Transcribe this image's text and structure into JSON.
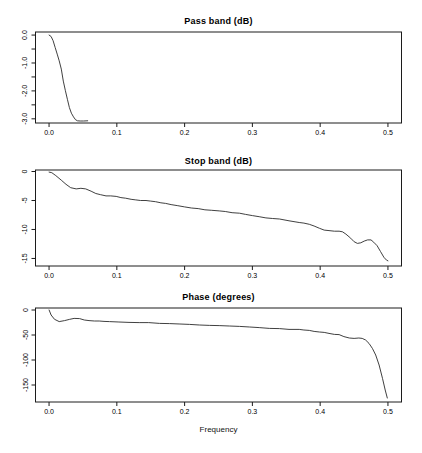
{
  "figure": {
    "width": 422,
    "height": 453,
    "background": "#ffffff",
    "axis_color": "#1c1c1c",
    "curve_color": "#2a2a2a",
    "text_color": "#000000"
  },
  "chart_data": [
    {
      "type": "line",
      "title": "Pass band (dB)",
      "xlabel": "",
      "ylabel": "",
      "xlim": [
        -0.02,
        0.52
      ],
      "ylim": [
        -3.15,
        0.11
      ],
      "xticks": [
        0.0,
        0.1,
        0.2,
        0.3,
        0.4,
        0.5
      ],
      "xtick_labels": [
        "0.0",
        "0.1",
        "0.2",
        "0.3",
        "0.4",
        "0.5"
      ],
      "yticks": [
        0,
        -1,
        -2,
        -3
      ],
      "ytick_labels": [
        "0.0",
        "-1.0",
        "-2.0",
        "-3.0"
      ],
      "yticks_minor": [
        -0.5,
        -1.5,
        -2.5
      ],
      "x": [
        0,
        0.003,
        0.006,
        0.009,
        0.012,
        0.015,
        0.018,
        0.021,
        0.024,
        0.027,
        0.03,
        0.033,
        0.036,
        0.039,
        0.042,
        0.046,
        0.051,
        0.057
      ],
      "y": [
        0,
        -0.05,
        -0.2,
        -0.45,
        -0.68,
        -0.92,
        -1.22,
        -1.65,
        -1.98,
        -2.3,
        -2.6,
        -2.8,
        -2.93,
        -3.03,
        -3.07,
        -3.08,
        -3.08,
        -3.07
      ]
    },
    {
      "type": "line",
      "title": "Stop band (dB)",
      "xlabel": "",
      "ylabel": "",
      "xlim": [
        -0.02,
        0.52
      ],
      "ylim": [
        -16.3,
        0.26
      ],
      "xticks": [
        0.0,
        0.1,
        0.2,
        0.3,
        0.4,
        0.5
      ],
      "xtick_labels": [
        "0.0",
        "0.1",
        "0.2",
        "0.3",
        "0.4",
        "0.5"
      ],
      "yticks": [
        0,
        -5,
        -10,
        -15
      ],
      "ytick_labels": [
        "0",
        "-5",
        "-10",
        "-15"
      ],
      "yticks_minor": [],
      "x": [
        0,
        0.004,
        0.01,
        0.018,
        0.025,
        0.032,
        0.04,
        0.047,
        0.054,
        0.062,
        0.069,
        0.076,
        0.084,
        0.091,
        0.099,
        0.106,
        0.113,
        0.121,
        0.128,
        0.135,
        0.143,
        0.15,
        0.157,
        0.165,
        0.172,
        0.18,
        0.19,
        0.2,
        0.21,
        0.22,
        0.23,
        0.24,
        0.251,
        0.26,
        0.27,
        0.281,
        0.29,
        0.3,
        0.31,
        0.32,
        0.33,
        0.34,
        0.354,
        0.369,
        0.376,
        0.384,
        0.391,
        0.399,
        0.406,
        0.413,
        0.421,
        0.428,
        0.433,
        0.438,
        0.445,
        0.45,
        0.455,
        0.46,
        0.465,
        0.47,
        0.475,
        0.479,
        0.484,
        0.489,
        0.494,
        0.498,
        0.5
      ],
      "y": [
        -0.1,
        -0.2,
        -0.7,
        -1.5,
        -2.2,
        -2.8,
        -3.0,
        -2.9,
        -3.0,
        -3.4,
        -3.8,
        -4.0,
        -4.2,
        -4.2,
        -4.3,
        -4.5,
        -4.6,
        -4.8,
        -4.9,
        -5.0,
        -5.0,
        -5.1,
        -5.2,
        -5.4,
        -5.5,
        -5.7,
        -5.9,
        -6.1,
        -6.3,
        -6.4,
        -6.6,
        -6.7,
        -6.8,
        -6.9,
        -7.1,
        -7.2,
        -7.4,
        -7.6,
        -7.8,
        -8.0,
        -8.1,
        -8.2,
        -8.5,
        -8.8,
        -8.9,
        -9.1,
        -9.4,
        -9.8,
        -10.1,
        -10.2,
        -10.3,
        -10.3,
        -10.4,
        -10.8,
        -11.5,
        -12.1,
        -12.4,
        -12.3,
        -12.0,
        -11.8,
        -11.8,
        -12.2,
        -12.8,
        -13.8,
        -14.8,
        -15.3,
        -15.4
      ]
    },
    {
      "type": "line",
      "title": "Phase (degrees)",
      "xlabel": "Frequency",
      "ylabel": "",
      "xlim": [
        -0.02,
        0.52
      ],
      "ylim": [
        -184,
        4
      ],
      "xticks": [
        0.0,
        0.1,
        0.2,
        0.3,
        0.4,
        0.5
      ],
      "xtick_labels": [
        "0.0",
        "0.1",
        "0.2",
        "0.3",
        "0.4",
        "0.5"
      ],
      "yticks": [
        0,
        -50,
        -100,
        -150
      ],
      "ytick_labels": [
        "0",
        "-50",
        "-100",
        "-150"
      ],
      "yticks_minor": [],
      "x": [
        0,
        0.003,
        0.008,
        0.015,
        0.023,
        0.03,
        0.037,
        0.045,
        0.052,
        0.059,
        0.067,
        0.074,
        0.081,
        0.089,
        0.103,
        0.118,
        0.133,
        0.147,
        0.163,
        0.178,
        0.193,
        0.207,
        0.222,
        0.237,
        0.251,
        0.266,
        0.281,
        0.296,
        0.31,
        0.325,
        0.34,
        0.354,
        0.369,
        0.376,
        0.384,
        0.391,
        0.399,
        0.406,
        0.413,
        0.421,
        0.428,
        0.435,
        0.443,
        0.45,
        0.457,
        0.462,
        0.467,
        0.472,
        0.477,
        0.482,
        0.487,
        0.492,
        0.496,
        0.499
      ],
      "y": [
        0,
        -10,
        -18.6,
        -23.3,
        -21.3,
        -18.7,
        -16.7,
        -17.3,
        -20,
        -21.3,
        -22,
        -22,
        -22.7,
        -23.3,
        -24,
        -24.7,
        -25.3,
        -25.3,
        -26.7,
        -27.3,
        -28,
        -28.7,
        -30,
        -30.7,
        -31.3,
        -32,
        -32.7,
        -34,
        -35.3,
        -36.7,
        -37.3,
        -38.7,
        -38.7,
        -40,
        -40.7,
        -42.7,
        -44,
        -44.7,
        -46.7,
        -48.7,
        -49.3,
        -53.3,
        -56,
        -56.7,
        -56,
        -56.7,
        -60,
        -66.7,
        -76.7,
        -90,
        -110,
        -136.7,
        -160,
        -176
      ]
    }
  ]
}
